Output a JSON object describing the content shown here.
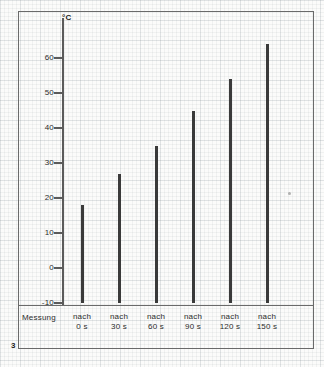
{
  "page": {
    "page_number": "3"
  },
  "chart_data": {
    "type": "bar",
    "title": "",
    "subtitle": "",
    "xlabel": "Messung",
    "ylabel": "°C",
    "unit": "°C",
    "categories": [
      "nach\n0 s",
      "nach\n30 s",
      "nach\n60 s",
      "nach\n90 s",
      "nach\n120 s",
      "nach\n150 s"
    ],
    "category_lines": [
      {
        "line1": "nach",
        "line2": "0 s"
      },
      {
        "line1": "nach",
        "line2": "30 s"
      },
      {
        "line1": "nach",
        "line2": "60 s"
      },
      {
        "line1": "nach",
        "line2": "90 s"
      },
      {
        "line1": "nach",
        "line2": "120 s"
      },
      {
        "line1": "nach",
        "line2": "150 s"
      }
    ],
    "values": [
      18,
      27,
      35,
      45,
      54,
      64
    ],
    "ylim": [
      -10,
      65
    ],
    "yticks": [
      60,
      50,
      40,
      30,
      20,
      10,
      0,
      -10
    ],
    "ytick_labels": [
      "60",
      "50",
      "40",
      "30",
      "20",
      "10",
      "0",
      "-10"
    ],
    "grid": false,
    "legend": null,
    "bar_color": "#3a3a3a",
    "axis_color": "#5b5b5b",
    "baseline": -10
  },
  "axis_title": "°C",
  "measure_label": "Messung"
}
